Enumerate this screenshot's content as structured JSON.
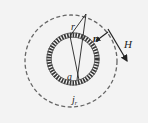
{
  "diagram": {
    "type": "physics-figure",
    "labels": {
      "r": "r",
      "a": "a",
      "n": "n",
      "H": "H",
      "j_main": "j",
      "j_sub": "r"
    },
    "colors": {
      "background": "#f3f3f3",
      "ink": "#222222",
      "dash": "#666666"
    },
    "geometry": {
      "outer_circle": {
        "cx": 71,
        "cy": 61,
        "r": 46,
        "style": "dashed"
      },
      "inner_ring": {
        "cx": 73,
        "cy": 59,
        "r": 24,
        "style": "braided"
      }
    }
  }
}
